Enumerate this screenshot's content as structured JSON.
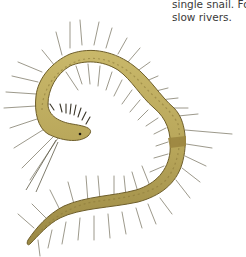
{
  "page": {
    "text_lines": [
      "single snail. Fo",
      "slow rivers."
    ]
  },
  "illustration": {
    "subject": "bristle worm",
    "icon": "worm-illustration",
    "colors": {
      "body_fill": "#b8a65a",
      "body_dark": "#8c7a3a",
      "body_outline": "#6e5e2a",
      "band": "#9c8640",
      "bristles": "#6f6a55",
      "eye": "#1e1a10"
    }
  }
}
